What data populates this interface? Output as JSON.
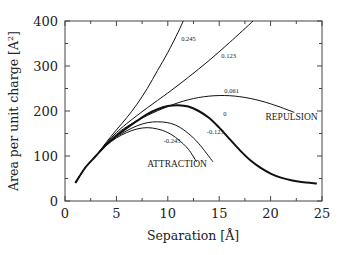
{
  "chart_data": {
    "type": "line",
    "title": "",
    "xlabel": "Separation [Å]",
    "ylabel": "Area per unit charge [A²]",
    "xlim": [
      0,
      25
    ],
    "ylim": [
      0,
      400
    ],
    "xticks": [
      0,
      5,
      10,
      15,
      20,
      25
    ],
    "yticks": [
      0,
      100,
      200,
      300,
      400
    ],
    "grid": false,
    "legend": "none (inline curve labels)",
    "annotations": [
      {
        "text": "REPULSION",
        "x": 19.5,
        "y": 180
      },
      {
        "text": "ATTRACTION",
        "x": 8.0,
        "y": 75
      }
    ],
    "series": [
      {
        "name": "0.245",
        "thick": false,
        "x": [
          1.0,
          2.0,
          3.0,
          4.0,
          5.0,
          6.0,
          7.0,
          8.0,
          9.0,
          10.0,
          11.0,
          11.5
        ],
        "y": [
          40,
          75,
          100,
          130,
          158,
          185,
          215,
          250,
          290,
          330,
          375,
          400
        ]
      },
      {
        "name": "0.123",
        "thick": false,
        "x": [
          1.0,
          2.0,
          3.0,
          4.0,
          5.0,
          6.0,
          8.0,
          10.0,
          12.0,
          14.0,
          16.0,
          18.3
        ],
        "y": [
          40,
          75,
          100,
          128,
          152,
          172,
          207,
          240,
          275,
          312,
          352,
          400
        ]
      },
      {
        "name": "0.061",
        "thick": false,
        "x": [
          1.0,
          2.0,
          3.0,
          4.0,
          5.0,
          6.0,
          8.0,
          10.0,
          12.0,
          14.0,
          16.0,
          18.0,
          20.0,
          22.3
        ],
        "y": [
          40,
          75,
          100,
          126,
          148,
          165,
          190,
          210,
          225,
          233,
          234,
          228,
          216,
          197
        ]
      },
      {
        "name": "0",
        "thick": true,
        "x": [
          1.0,
          2.0,
          3.0,
          4.0,
          5.0,
          6.0,
          7.0,
          8.0,
          9.0,
          10.0,
          11.0,
          12.0,
          13.0,
          14.0,
          15.0,
          16.0,
          17.0,
          18.0,
          19.0,
          20.0,
          21.0,
          22.0,
          23.0,
          24.5
        ],
        "y": [
          40,
          75,
          100,
          125,
          145,
          162,
          178,
          193,
          204,
          211,
          213,
          210,
          200,
          185,
          163,
          138,
          113,
          91,
          74,
          61,
          52,
          46,
          42,
          39
        ]
      },
      {
        "name": "-0.123",
        "thick": false,
        "x": [
          1.0,
          2.0,
          3.0,
          4.0,
          5.0,
          6.0,
          7.0,
          8.0,
          9.0,
          10.0,
          11.0,
          12.0,
          13.0,
          14.4
        ],
        "y": [
          40,
          75,
          100,
          124,
          142,
          156,
          167,
          174,
          176,
          174,
          166,
          150,
          128,
          87
        ]
      },
      {
        "name": "-0.245",
        "thick": false,
        "x": [
          1.0,
          2.0,
          3.0,
          4.0,
          5.0,
          6.0,
          7.0,
          8.0,
          9.0,
          10.0,
          11.0,
          12.0,
          12.8
        ],
        "y": [
          40,
          75,
          100,
          123,
          140,
          152,
          160,
          163,
          160,
          152,
          137,
          115,
          87
        ]
      }
    ],
    "curve_labels": [
      {
        "text": "0.245",
        "x": 11.3,
        "y": 355
      },
      {
        "text": "0.123",
        "x": 15.2,
        "y": 318
      },
      {
        "text": "0.061",
        "x": 15.5,
        "y": 240
      },
      {
        "text": "0",
        "x": 15.4,
        "y": 188
      },
      {
        "text": "-0.123",
        "x": 13.8,
        "y": 148
      },
      {
        "text": "-0.245",
        "x": 9.6,
        "y": 130
      }
    ]
  }
}
